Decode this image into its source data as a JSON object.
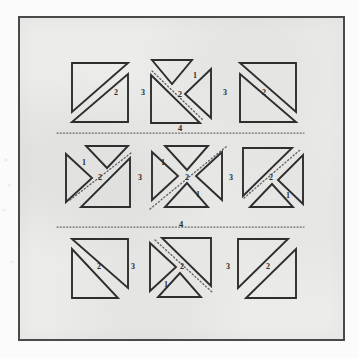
{
  "figure": {
    "kind": "geometric-block-diagram",
    "background_color": "#ececeb",
    "page_color": "#fbfbfb",
    "ink_color": "#2b2b2b",
    "frame_color": "#4a4a4a",
    "frame": {
      "x": 18,
      "y": 16,
      "width": 327,
      "height": 325
    }
  },
  "grid": {
    "rows": 3,
    "cols": 3,
    "cells": [
      {
        "id": "r1c1",
        "name": "top-left-block",
        "labels": [
          "2",
          "3"
        ]
      },
      {
        "id": "r1c2",
        "name": "top-center-block",
        "labels": [
          "1",
          "2",
          "3"
        ]
      },
      {
        "id": "r1c3",
        "name": "top-right-block",
        "labels": [
          "2"
        ]
      },
      {
        "id": "r2c1",
        "name": "middle-left-block",
        "labels": [
          "1",
          "2",
          "3"
        ]
      },
      {
        "id": "r2c2",
        "name": "middle-center-block",
        "labels": [
          "1",
          "2",
          "1",
          "3"
        ]
      },
      {
        "id": "r2c3",
        "name": "middle-right-block",
        "labels": [
          "2",
          "1"
        ]
      },
      {
        "id": "r3c1",
        "name": "bottom-left-block",
        "labels": [
          "2",
          "3"
        ]
      },
      {
        "id": "r3c2",
        "name": "bottom-center-block",
        "labels": [
          "2",
          "1",
          "3"
        ]
      },
      {
        "id": "r3c3",
        "name": "bottom-right-block",
        "labels": [
          "2"
        ]
      }
    ]
  },
  "separators": [
    {
      "id": "sep-top",
      "label": "4",
      "y": 133,
      "x1": 57,
      "x2": 304,
      "style": "dotted"
    },
    {
      "id": "sep-bottom",
      "label": "4",
      "y": 227,
      "x1": 57,
      "x2": 304,
      "style": "dotted"
    }
  ],
  "labels": {
    "row1": {
      "c1_2": "2",
      "c1_3": "3",
      "c2_1": "1",
      "c2_2": "2",
      "c2_3": "3",
      "c3_2": "2"
    },
    "row2": {
      "c1_1": "1",
      "c1_2": "2",
      "c1_3": "3",
      "c2_1": "1",
      "c2_2": "2",
      "c2_1b": "1",
      "c2_3": "3",
      "c3_2": "2",
      "c3_1": "1"
    },
    "row3": {
      "c1_2": "2",
      "c1_3": "3",
      "c2_2": "2",
      "c2_1": "1",
      "c2_3": "3",
      "c3_2": "2"
    },
    "sep_top": "4",
    "sep_bottom": "4"
  }
}
